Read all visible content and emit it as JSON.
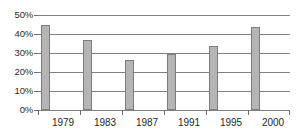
{
  "chart_data": {
    "type": "bar",
    "title": "",
    "subtitle": "",
    "xlabel": "",
    "ylabel": "",
    "categories": [
      "1979",
      "1983",
      "1987",
      "1991",
      "1995",
      "2000"
    ],
    "values": [
      45,
      37,
      26.5,
      29.5,
      33.5,
      43.5
    ],
    "value_suffix": "%",
    "ylim": [
      0,
      50
    ],
    "ytick_values": [
      0,
      10,
      20,
      30,
      40,
      50
    ],
    "ytick_labels": [
      "0%",
      "10%",
      "20%",
      "30%",
      "40%",
      "50%"
    ],
    "xtick_labels": [
      "1979",
      "1983",
      "1987",
      "1991",
      "1995",
      "2000"
    ],
    "grid": true,
    "grid_axis": "y",
    "legend": false,
    "legend_position": "none",
    "annotations": [],
    "series": [
      {
        "name": "",
        "values": [
          45,
          37,
          26.5,
          29.5,
          33.5,
          43.5
        ]
      }
    ],
    "colors": {
      "bar_fill": "#b5b5b5",
      "bar_border": "#7d7d7d",
      "gridline": "#808080",
      "background": "#ffffff",
      "text": "#1f1f1f"
    }
  }
}
